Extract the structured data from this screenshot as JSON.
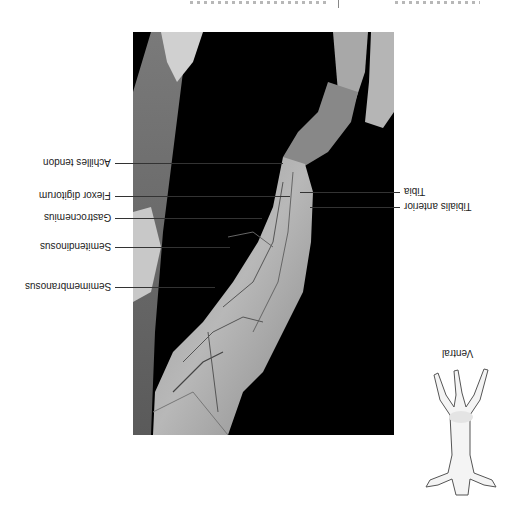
{
  "figure": {
    "orientation": "rotated-180",
    "view_label": "Ventral",
    "photo_description": "Dissected hind limb, muscles of thigh and shank, on black background",
    "labels_left": [
      {
        "text": "Achilles tendon",
        "y": 163
      },
      {
        "text": "Flexor digitorum",
        "y": 196
      },
      {
        "text": "Gastrocnemius",
        "y": 218
      },
      {
        "text": "Semitendinosus",
        "y": 247
      },
      {
        "text": "Semimembranosus",
        "y": 287
      }
    ],
    "labels_right": [
      {
        "text": "Tibia",
        "y": 192
      },
      {
        "text": "Tibialis anterior",
        "y": 207
      }
    ]
  },
  "colors": {
    "background": "#ffffff",
    "photo_bg": "#000000",
    "leader": "#333333",
    "text": "#222222"
  }
}
